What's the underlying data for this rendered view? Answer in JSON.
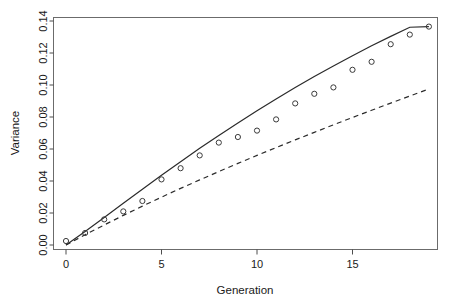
{
  "chart_data": {
    "type": "scatter",
    "title": "",
    "xlabel": "Generation",
    "ylabel": "Variance",
    "xlim": [
      -0.7,
      19.4
    ],
    "ylim": [
      -0.004,
      0.1445
    ],
    "grid": false,
    "legend": "none",
    "x_ticks": [
      0,
      5,
      10,
      15
    ],
    "x_tick_labels": [
      "0",
      "5",
      "10",
      "15"
    ],
    "y_ticks": [
      0.0,
      0.02,
      0.04,
      0.06,
      0.08,
      0.1,
      0.12,
      0.14
    ],
    "y_tick_labels": [
      "0.00",
      "0.02",
      "0.04",
      "0.06",
      "0.08",
      "0.10",
      "0.12",
      "0.14"
    ],
    "series": [
      {
        "name": "observed-points",
        "style": "open-circle-markers",
        "marker": "circle",
        "x": [
          0,
          1,
          2,
          3,
          4,
          5,
          6,
          7,
          8,
          9,
          10,
          11,
          12,
          13,
          14,
          15,
          16,
          17,
          18,
          19
        ],
        "values": [
          0.0025,
          0.0075,
          0.016,
          0.021,
          0.0275,
          0.041,
          0.048,
          0.056,
          0.064,
          0.0675,
          0.0715,
          0.0785,
          0.0885,
          0.0945,
          0.0985,
          0.1095,
          0.1145,
          0.1255,
          0.1315,
          0.1365
        ]
      },
      {
        "name": "solid-prediction-curve",
        "style": "solid-line",
        "x": [
          0,
          1,
          2,
          3,
          4,
          5,
          6,
          7,
          8,
          9,
          10,
          11,
          12,
          13,
          14,
          15,
          16,
          17,
          18,
          19
        ],
        "values": [
          0.0,
          0.0085,
          0.0172,
          0.0261,
          0.0349,
          0.0436,
          0.0521,
          0.0604,
          0.0685,
          0.0763,
          0.0839,
          0.0913,
          0.0984,
          0.1053,
          0.1119,
          0.1183,
          0.1245,
          0.1304,
          0.1361,
          0.1365
        ]
      },
      {
        "name": "dashed-prediction-curve",
        "style": "dashed-line",
        "x": [
          0,
          1,
          2,
          3,
          4,
          5,
          6,
          7,
          8,
          9,
          10,
          11,
          12,
          13,
          14,
          15,
          16,
          17,
          18,
          19
        ],
        "values": [
          0.0,
          0.0064,
          0.0125,
          0.0185,
          0.0243,
          0.0299,
          0.0354,
          0.0407,
          0.0459,
          0.051,
          0.056,
          0.0609,
          0.0657,
          0.0704,
          0.0751,
          0.0797,
          0.0842,
          0.0887,
          0.0931,
          0.0975
        ]
      }
    ]
  }
}
